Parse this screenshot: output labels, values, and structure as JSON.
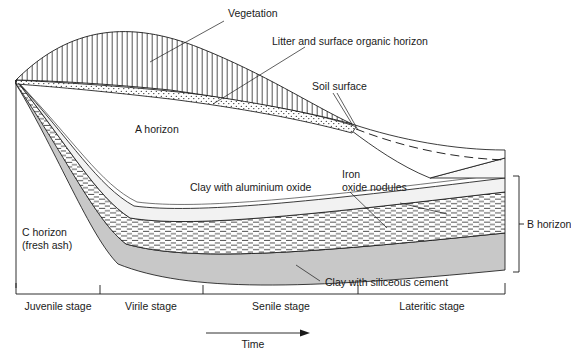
{
  "diagram": {
    "axis": {
      "time_label": "Time",
      "time_arrow": "arrow-right-icon",
      "stages": [
        {
          "label": "Juvenile stage",
          "x_start": 16,
          "x_end": 100
        },
        {
          "label": "Virile stage",
          "x_start": 100,
          "x_end": 203
        },
        {
          "label": "Senile stage",
          "x_start": 203,
          "x_end": 358
        },
        {
          "label": "Lateritic stage",
          "x_start": 358,
          "x_end": 505
        }
      ]
    },
    "labels": {
      "vegetation": "Vegetation",
      "litter": "Litter and surface organic horizon",
      "soil_surface": "Soil surface",
      "a_horizon": "A horizon",
      "c_horizon_line1": "C horizon",
      "c_horizon_line2": "(fresh ash)",
      "clay_aluminium": "Clay with aluminium oxide",
      "iron_line1": "Iron",
      "iron_line2": "oxide nodules",
      "clay_siliceous": "Clay with siliceous cement",
      "b_horizon": "B horizon"
    },
    "colors": {
      "stroke": "#1a1a1a",
      "siliceous_gray": "#c8c8c8",
      "aluminium_band": "#f2f2f2",
      "litter_fill": "#ffffff",
      "background": "#ffffff"
    },
    "patterns": {
      "vegetation": "vertical-line-hatch",
      "litter": "stipple-dots",
      "iron_oxide": "horizontal-dash-hatch",
      "siliceous": "solid-gray"
    }
  }
}
